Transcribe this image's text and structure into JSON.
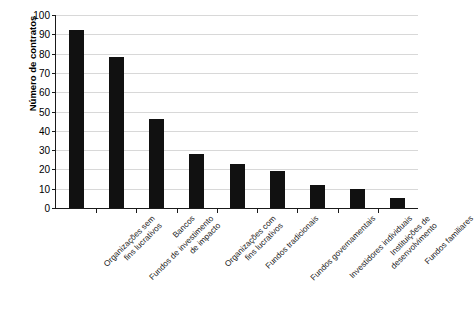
{
  "chart_data": {
    "type": "bar",
    "title": "",
    "xlabel": "",
    "ylabel": "Número de contratos",
    "ylim": [
      0,
      100
    ],
    "ytick_step": 10,
    "yticks": [
      0,
      10,
      20,
      30,
      40,
      50,
      60,
      70,
      80,
      90,
      100
    ],
    "grid": true,
    "legend": false,
    "bar_color": "#111111",
    "gridline_color": "#d8d8d8",
    "axis_color": "#1a1a1a",
    "categories": [
      "Organizações sem fins lucrativos",
      "Fundos de investimento de impacto",
      "Bancos",
      "Organizações com fins lucrativos",
      "Fundos tradicionais",
      "Fundos governamentais",
      "Investidores individuais",
      "Instituições de desenvolvimento",
      "Fundos familiares"
    ],
    "category_lines": [
      [
        "Organizações sem",
        "fins lucrativos"
      ],
      [
        "Fundos de investimento",
        "de impacto"
      ],
      [
        "Bancos",
        ""
      ],
      [
        "Organizações com",
        "fins lucrativos"
      ],
      [
        "Fundos tradicionais",
        ""
      ],
      [
        "Fundos governamentais",
        ""
      ],
      [
        "Investidores individuais",
        ""
      ],
      [
        "Instituições de",
        "desenvolvimento"
      ],
      [
        "Fundos familiares",
        ""
      ]
    ],
    "values": [
      92,
      78,
      46,
      28,
      23,
      19,
      12,
      10,
      5
    ]
  }
}
